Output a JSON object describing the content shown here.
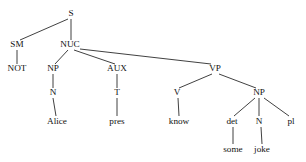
{
  "diagram": {
    "type": "syntax-tree",
    "colors": {
      "background": "#ffffff",
      "edge": "#2b2b2b",
      "text": "#111111"
    },
    "nodes": [
      {
        "id": "S",
        "label": "S",
        "x": 71,
        "y": 16,
        "kind": "nonterminal"
      },
      {
        "id": "SM",
        "label": "SM",
        "x": 17,
        "y": 47,
        "kind": "nonterminal"
      },
      {
        "id": "NUC",
        "label": "NUC",
        "x": 70,
        "y": 47,
        "kind": "nonterminal"
      },
      {
        "id": "NOT",
        "label": "NOT",
        "x": 17,
        "y": 71,
        "kind": "nonterminal"
      },
      {
        "id": "NP1",
        "label": "NP",
        "x": 53,
        "y": 71,
        "kind": "nonterminal"
      },
      {
        "id": "AUX",
        "label": "AUX",
        "x": 117,
        "y": 71,
        "kind": "nonterminal"
      },
      {
        "id": "VP",
        "label": "VP",
        "x": 215,
        "y": 71,
        "kind": "nonterminal"
      },
      {
        "id": "N1",
        "label": "N",
        "x": 53,
        "y": 95,
        "kind": "nonterminal"
      },
      {
        "id": "T",
        "label": "T",
        "x": 117,
        "y": 95,
        "kind": "nonterminal"
      },
      {
        "id": "V",
        "label": "V",
        "x": 177,
        "y": 95,
        "kind": "nonterminal"
      },
      {
        "id": "NP2",
        "label": "NP",
        "x": 259,
        "y": 95,
        "kind": "nonterminal"
      },
      {
        "id": "Alice",
        "label": "Alice",
        "x": 57,
        "y": 124,
        "kind": "terminal"
      },
      {
        "id": "pres",
        "label": "pres",
        "x": 117,
        "y": 124,
        "kind": "terminal"
      },
      {
        "id": "know",
        "label": "know",
        "x": 179,
        "y": 124,
        "kind": "terminal"
      },
      {
        "id": "det",
        "label": "det",
        "x": 232,
        "y": 124,
        "kind": "terminal"
      },
      {
        "id": "N2",
        "label": "N",
        "x": 259,
        "y": 124,
        "kind": "nonterminal"
      },
      {
        "id": "pl",
        "label": "pl",
        "x": 291,
        "y": 124,
        "kind": "terminal"
      },
      {
        "id": "some",
        "label": "some",
        "x": 233,
        "y": 152,
        "kind": "terminal"
      },
      {
        "id": "joke",
        "label": "joke",
        "x": 262,
        "y": 152,
        "kind": "terminal"
      }
    ],
    "edges": [
      {
        "from": "S",
        "to": "SM",
        "x1": 68,
        "y1": 19,
        "x2": 20,
        "y2": 40
      },
      {
        "from": "S",
        "to": "NUC",
        "x1": 71,
        "y1": 19,
        "x2": 71,
        "y2": 40
      },
      {
        "from": "SM",
        "to": "NOT",
        "x1": 17,
        "y1": 50,
        "x2": 17,
        "y2": 64
      },
      {
        "from": "NUC",
        "to": "NP1",
        "x1": 68,
        "y1": 50,
        "x2": 55,
        "y2": 64
      },
      {
        "from": "NUC",
        "to": "AUX",
        "x1": 74,
        "y1": 50,
        "x2": 115,
        "y2": 64
      },
      {
        "from": "NUC",
        "to": "VP",
        "x1": 80,
        "y1": 49,
        "x2": 211,
        "y2": 64
      },
      {
        "from": "NP1",
        "to": "N1",
        "x1": 53,
        "y1": 74,
        "x2": 53,
        "y2": 88
      },
      {
        "from": "AUX",
        "to": "T",
        "x1": 117,
        "y1": 74,
        "x2": 117,
        "y2": 88
      },
      {
        "from": "VP",
        "to": "V",
        "x1": 212,
        "y1": 74,
        "x2": 179,
        "y2": 88
      },
      {
        "from": "VP",
        "to": "NP2",
        "x1": 219,
        "y1": 74,
        "x2": 256,
        "y2": 88
      },
      {
        "from": "N1",
        "to": "Alice",
        "x1": 53,
        "y1": 98,
        "x2": 56,
        "y2": 116
      },
      {
        "from": "T",
        "to": "pres",
        "x1": 117,
        "y1": 98,
        "x2": 117,
        "y2": 116
      },
      {
        "from": "V",
        "to": "know",
        "x1": 178,
        "y1": 98,
        "x2": 179,
        "y2": 116
      },
      {
        "from": "NP2",
        "to": "det",
        "x1": 255,
        "y1": 98,
        "x2": 234,
        "y2": 116
      },
      {
        "from": "NP2",
        "to": "N2",
        "x1": 259,
        "y1": 98,
        "x2": 259,
        "y2": 116
      },
      {
        "from": "NP2",
        "to": "pl",
        "x1": 264,
        "y1": 98,
        "x2": 289,
        "y2": 116
      },
      {
        "from": "det",
        "to": "some",
        "x1": 233,
        "y1": 127,
        "x2": 233,
        "y2": 144
      },
      {
        "from": "N2",
        "to": "joke",
        "x1": 261,
        "y1": 127,
        "x2": 262,
        "y2": 144
      }
    ]
  }
}
